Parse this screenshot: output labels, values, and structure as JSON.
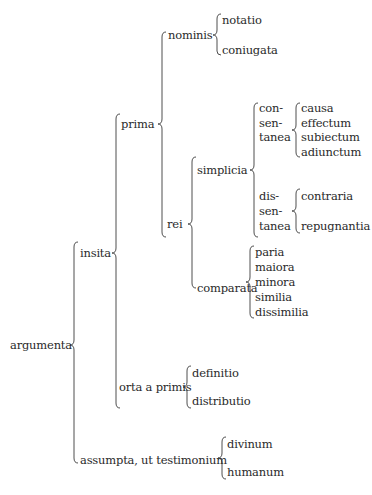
{
  "diagram": {
    "type": "bracket-tree",
    "root": {
      "label": "argumenta",
      "children": [
        {
          "label": "insita",
          "children": [
            {
              "label": "prima",
              "children": [
                {
                  "label": "nominis",
                  "children": [
                    "notatio",
                    "coniugata"
                  ]
                },
                {
                  "label": "rei",
                  "children": [
                    {
                      "label": "simplicia",
                      "children": [
                        {
                          "label_lines": [
                            "con-",
                            "sen-",
                            "tanea"
                          ],
                          "children": [
                            "causa",
                            "effectum",
                            "subiectum",
                            "adiunctum"
                          ]
                        },
                        {
                          "label_lines": [
                            "dis-",
                            "sen-",
                            "tanea"
                          ],
                          "children": [
                            "contraria",
                            "repugnantia"
                          ]
                        }
                      ]
                    },
                    {
                      "label": "comparata",
                      "children": [
                        "paria",
                        "maiora",
                        "minora",
                        "similia",
                        "dissimilia"
                      ]
                    }
                  ]
                }
              ]
            },
            {
              "label": "orta a primis",
              "children": [
                "definitio",
                "distributio"
              ]
            }
          ]
        },
        {
          "label": "assumpta, ut testimonium",
          "children": [
            "divinum",
            "humanum"
          ]
        }
      ]
    }
  },
  "labels": {
    "argumenta": "argumenta",
    "insita": "insita",
    "prima": "prima",
    "nominis": "nominis",
    "notatio": "notatio",
    "coniugata": "coniugata",
    "rei": "rei",
    "simplicia": "simplicia",
    "consentanea": [
      "con-",
      "sen-",
      "tanea"
    ],
    "causa": "causa",
    "effectum": "effectum",
    "subiectum": "subiectum",
    "adiunctum": "adiunctum",
    "dissentanea": [
      "dis-",
      "sen-",
      "tanea"
    ],
    "contraria": "contraria",
    "repugnantia": "repugnantia",
    "comparata": "comparata",
    "paria": "paria",
    "maiora": "maiora",
    "minora": "minora",
    "similia": "similia",
    "dissimilia": "dissimilia",
    "orta_a_primis": "orta a primis",
    "definitio": "definitio",
    "distributio": "distributio",
    "assumpta": "assumpta, ut testimonium",
    "divinum": "divinum",
    "humanum": "humanum"
  },
  "colors": {
    "text": "#2a2a2a",
    "bracket": "#3a3a3a",
    "background": "#ffffff"
  }
}
